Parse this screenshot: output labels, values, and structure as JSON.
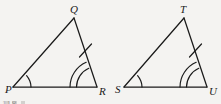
{
  "figure": {
    "kind": "geometry-diagram",
    "background_color": "#f4f3f1",
    "ink_color": "#1a1a1a",
    "caption_fragment": "118",
    "triangles": [
      {
        "name": "triangle-pqr",
        "vertices": [
          {
            "label": "P",
            "x": 13,
            "y": 87,
            "label_x": 5,
            "label_y": 90,
            "marks": "single-arc"
          },
          {
            "label": "Q",
            "x": 74,
            "y": 18,
            "label_x": 70,
            "label_y": 11,
            "marks": "none"
          },
          {
            "label": "R",
            "x": 97,
            "y": 87,
            "label_x": 100,
            "label_y": 93,
            "marks": "double-arc"
          }
        ],
        "sides": [
          {
            "name": "PQ",
            "ticks": 0
          },
          {
            "name": "QR",
            "ticks": 1
          },
          {
            "name": "PR",
            "ticks": 0
          }
        ]
      },
      {
        "name": "triangle-stu",
        "vertices": [
          {
            "label": "S",
            "x": 124,
            "y": 87,
            "label_x": 116,
            "label_y": 90,
            "marks": "single-arc"
          },
          {
            "label": "T",
            "x": 184,
            "y": 18,
            "label_x": 180,
            "label_y": 11,
            "marks": "none"
          },
          {
            "label": "U",
            "x": 207,
            "y": 87,
            "label_x": 210,
            "label_y": 93,
            "marks": "double-arc"
          }
        ],
        "sides": [
          {
            "name": "ST",
            "ticks": 0
          },
          {
            "name": "TU",
            "ticks": 1
          },
          {
            "name": "SU",
            "ticks": 0
          }
        ]
      }
    ]
  }
}
